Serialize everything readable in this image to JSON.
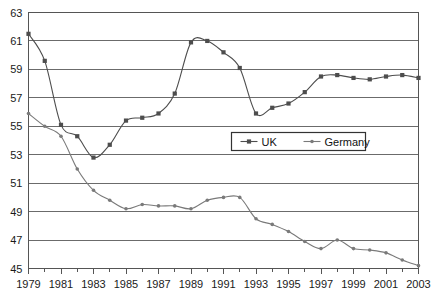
{
  "chart_data": {
    "type": "line",
    "title": "",
    "xlabel": "",
    "ylabel": "",
    "x": [
      1979,
      1980,
      1981,
      1982,
      1983,
      1984,
      1985,
      1986,
      1987,
      1988,
      1989,
      1990,
      1991,
      1992,
      1993,
      1994,
      1995,
      1996,
      1997,
      1998,
      1999,
      2000,
      2001,
      2002,
      2003
    ],
    "xlim": [
      1979,
      2003
    ],
    "ylim": [
      45,
      63
    ],
    "yticks": [
      45,
      47,
      49,
      51,
      53,
      55,
      57,
      59,
      61,
      63
    ],
    "xticks": [
      1979,
      1981,
      1983,
      1985,
      1987,
      1989,
      1991,
      1993,
      1995,
      1997,
      1999,
      2001,
      2003
    ],
    "xtick_labels": [
      "1979",
      "1981",
      "1983",
      "1985",
      "1987",
      "1989",
      "1991",
      "1993",
      "1995",
      "1997",
      "1999",
      "2001",
      "2003"
    ],
    "ytick_labels": [
      "45",
      "47",
      "49",
      "51",
      "53",
      "55",
      "57",
      "59",
      "61",
      "63"
    ],
    "grid": true,
    "grid_axis": "y",
    "legend_position": "center-right",
    "series": [
      {
        "name": "UK",
        "color": "#4d4d4d",
        "marker": "square",
        "values": [
          61.5,
          59.6,
          55.1,
          54.3,
          52.8,
          53.7,
          55.4,
          55.6,
          55.9,
          57.3,
          60.9,
          61.0,
          60.2,
          59.1,
          55.9,
          56.3,
          56.6,
          57.4,
          58.5,
          58.6,
          58.4,
          58.3,
          58.5,
          58.6,
          58.4
        ]
      },
      {
        "name": "Germany",
        "color": "#7a7a7a",
        "marker": "dot",
        "values": [
          55.9,
          55.0,
          54.3,
          52.0,
          50.5,
          49.8,
          49.2,
          49.5,
          49.4,
          49.4,
          49.2,
          49.8,
          50.0,
          50.0,
          48.5,
          48.1,
          47.6,
          46.9,
          46.4,
          47.0,
          46.4,
          46.3,
          46.1,
          45.6,
          45.2
        ]
      }
    ],
    "legend_entries": [
      "UK",
      "Germany"
    ]
  },
  "legend": {
    "items": [
      {
        "label": "UK"
      },
      {
        "label": "Germany"
      }
    ]
  }
}
